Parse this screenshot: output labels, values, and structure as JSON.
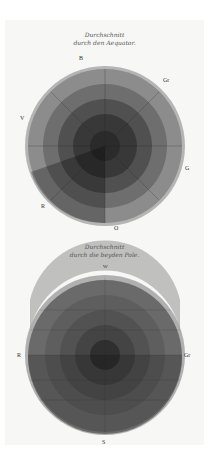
{
  "plate": {
    "equator": {
      "caption_line1": "Durchschnitt",
      "caption_line2": "durch den Aequator.",
      "labels": {
        "top": "B",
        "top_right": "Gr",
        "left": "V",
        "right": "G",
        "bottom_left": "R",
        "bottom": "O"
      },
      "rings_colors": [
        "#9a9a9a",
        "#7a7a7a",
        "#5a5a5a",
        "#3e3e3e",
        "#2a2a2a"
      ]
    },
    "poles": {
      "caption_line1": "Durchschnitt",
      "caption_line2": "durch die beyden Pole.",
      "labels": {
        "top": "W",
        "left": "R",
        "right": "Gr",
        "bottom": "S"
      },
      "rings_colors": [
        "#8e8e8e",
        "#6f6f6f",
        "#545454",
        "#3f3f3f",
        "#2c2c2c"
      ]
    }
  }
}
